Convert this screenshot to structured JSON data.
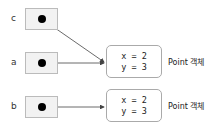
{
  "variables": [
    {
      "name": "c",
      "target": 0
    },
    {
      "name": "a",
      "target": 0
    },
    {
      "name": "b",
      "target": 1
    }
  ],
  "objects": [
    {
      "fields": [
        "x = 2",
        "y = 3"
      ],
      "label": "Point 객체"
    },
    {
      "fields": [
        "x = 2",
        "y = 3"
      ],
      "label": "Point 객체"
    }
  ]
}
